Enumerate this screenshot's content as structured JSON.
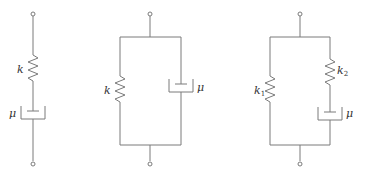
{
  "diagram": {
    "type": "mechanical rheological models (spring-dashpot)",
    "line_color": "#7a7a7a",
    "models": [
      {
        "name": "Maxwell model",
        "arrangement": "spring and dashpot in series",
        "labels": {
          "spring": "k",
          "dashpot": "μ"
        }
      },
      {
        "name": "Kelvin-Voigt model",
        "arrangement": "spring and dashpot in parallel",
        "labels": {
          "spring": "k",
          "dashpot": "μ"
        }
      },
      {
        "name": "Standard linear solid (Zener) model",
        "arrangement": "spring k1 in parallel with series branch of spring k2 and dashpot",
        "labels": {
          "spring1_base": "k",
          "spring1_sub": "1",
          "spring2_base": "k",
          "spring2_sub": "2",
          "dashpot": "μ"
        }
      }
    ]
  }
}
